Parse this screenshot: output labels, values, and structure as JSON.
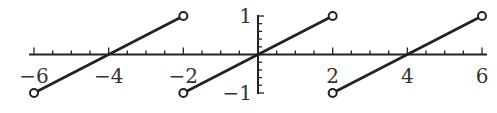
{
  "chart_data": {
    "type": "line",
    "title": "",
    "xlabel": "",
    "ylabel": "",
    "xlim": [
      -6,
      6
    ],
    "ylim": [
      -1,
      1
    ],
    "grid": false,
    "legend": "none",
    "x_ticks": {
      "major": [
        -6,
        -4,
        -2,
        2,
        4,
        6
      ],
      "major_labels": [
        "−6",
        "−4",
        "−2",
        "2",
        "4",
        "6"
      ],
      "minor_step": 0.5
    },
    "y_ticks": {
      "major": [
        1,
        -1
      ],
      "major_labels": [
        "1",
        "−1"
      ],
      "minor_step": 0.2
    },
    "series": [
      {
        "name": "segment-1",
        "x": [
          -6,
          -2
        ],
        "y": [
          -1,
          1
        ],
        "endpoints": [
          "open",
          "open"
        ]
      },
      {
        "name": "segment-2",
        "x": [
          -2,
          2
        ],
        "y": [
          -1,
          1
        ],
        "endpoints": [
          "open",
          "open"
        ]
      },
      {
        "name": "segment-3",
        "x": [
          2,
          6
        ],
        "y": [
          -1,
          1
        ],
        "endpoints": [
          "open",
          "open"
        ]
      }
    ]
  }
}
